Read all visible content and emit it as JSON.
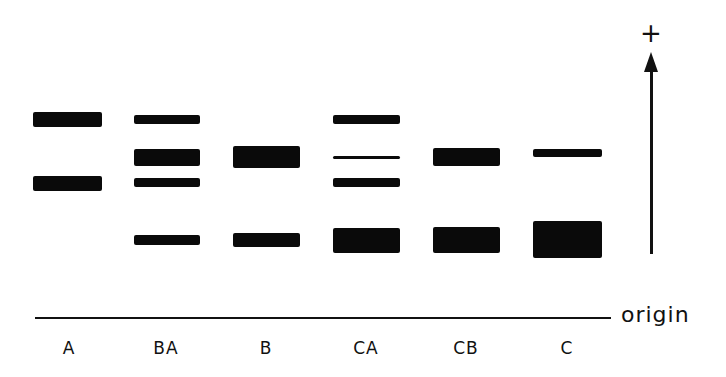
{
  "diagram": {
    "type": "gel-electrophoresis",
    "polarity_label": "+",
    "origin_label": "origin",
    "lanes": [
      {
        "label": "A",
        "center_x": 69,
        "x": 33,
        "width": 69,
        "bands": [
          {
            "top": 112,
            "height": 15
          },
          {
            "top": 176,
            "height": 15
          }
        ]
      },
      {
        "label": "BA",
        "center_x": 166,
        "x": 134,
        "width": 66,
        "bands": [
          {
            "top": 115,
            "height": 9
          },
          {
            "top": 149,
            "height": 17
          },
          {
            "top": 178,
            "height": 9
          },
          {
            "top": 235,
            "height": 10
          }
        ]
      },
      {
        "label": "B",
        "center_x": 266,
        "x": 233,
        "width": 67,
        "bands": [
          {
            "top": 146,
            "height": 22
          },
          {
            "top": 233,
            "height": 14
          }
        ]
      },
      {
        "label": "CA",
        "center_x": 366,
        "x": 333,
        "width": 67,
        "bands": [
          {
            "top": 115,
            "height": 9
          },
          {
            "top": 156,
            "height": 3
          },
          {
            "top": 178,
            "height": 9
          },
          {
            "top": 228,
            "height": 25
          }
        ]
      },
      {
        "label": "CB",
        "center_x": 466,
        "x": 433,
        "width": 67,
        "bands": [
          {
            "top": 148,
            "height": 18
          },
          {
            "top": 227,
            "height": 26
          }
        ]
      },
      {
        "label": "C",
        "center_x": 567,
        "x": 533,
        "width": 69,
        "bands": [
          {
            "top": 149,
            "height": 8
          },
          {
            "top": 221,
            "height": 37
          }
        ]
      }
    ]
  },
  "colors": {
    "ink": "#0a0a0a",
    "background": "#ffffff"
  }
}
